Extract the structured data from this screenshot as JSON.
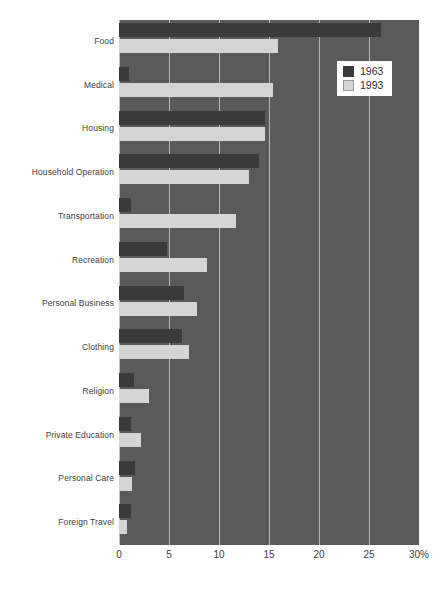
{
  "chart_data": {
    "type": "bar",
    "orientation": "horizontal",
    "title": "",
    "xlabel": "",
    "ylabel": "",
    "xlim": [
      0,
      30
    ],
    "xticks": [
      0,
      5,
      10,
      15,
      20,
      25,
      30
    ],
    "xticklabels": [
      "0",
      "5",
      "10",
      "15",
      "20",
      "25",
      "30%"
    ],
    "grid": true,
    "legend_position": "upper right",
    "categories": [
      "Food",
      "Medical",
      "Housing",
      "Household Operation",
      "Transportation",
      "Recreation",
      "Personal Business",
      "Clothing",
      "Religion",
      "Private Education",
      "Personal Care",
      "Foreign Travel"
    ],
    "series": [
      {
        "name": "1963",
        "color": "#3a3a3a",
        "values": [
          26.2,
          1.0,
          14.6,
          14.0,
          1.2,
          4.8,
          6.5,
          6.3,
          1.5,
          1.2,
          1.6,
          1.2
        ]
      },
      {
        "name": "1993",
        "color": "#d5d5d5",
        "values": [
          15.9,
          15.4,
          14.6,
          13.0,
          11.7,
          8.8,
          7.8,
          7.0,
          3.0,
          2.2,
          1.3,
          0.8
        ]
      }
    ]
  },
  "legend": {
    "items": [
      {
        "label": "1963",
        "swatch": "dark"
      },
      {
        "label": "1993",
        "swatch": "light"
      }
    ]
  },
  "colors": {
    "plot_background": "#5a5a5a",
    "page_background": "#ffffff",
    "gridline": "#c9c9c9",
    "series_1963": "#3a3a3a",
    "series_1993": "#d5d5d5",
    "text": "#3d3d3d"
  }
}
